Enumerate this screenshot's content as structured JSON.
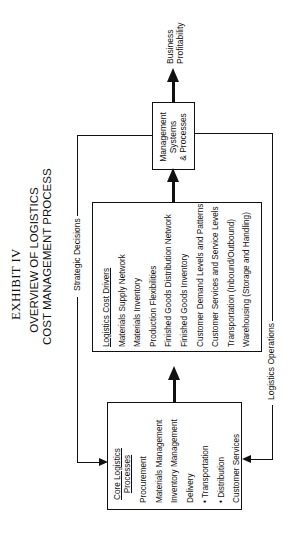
{
  "exhibit_label": "EXHIBIT IV",
  "title": {
    "line1": "OVERVIEW OF LOGISTICS",
    "line2": "COST MANAGEMENT PROCESS"
  },
  "flow_labels": {
    "strategic": "Strategic Decisions",
    "operations": "Logistics Operations"
  },
  "output": {
    "line1": "Business",
    "line2": "Profitability"
  },
  "management_box": {
    "line1": "Management",
    "line2": "Systems",
    "line3": "& Processes"
  },
  "cost_drivers": {
    "heading": "Logistics Cost Drivers",
    "items": [
      "Materials Supply Network",
      "Materials Inventory",
      "Production Flexibilities",
      "Finished Goods Distribution  Network",
      "Finished Goods Inventory",
      "Customer Demand Levels and Patterns",
      "Customer Services and Service Levels",
      "Transportation (Inbound/Outbound)",
      "Warehousing (Storage and Handling)"
    ]
  },
  "core_processes": {
    "heading1": "Core Logistics",
    "heading2": "Processes",
    "items": [
      "Procurement",
      "Materials Management",
      "Inventory Management",
      "Delivery",
      "•  Transportation",
      "•  Distribution",
      "Customer Services"
    ]
  },
  "colors": {
    "ink": "#111111",
    "background": "#ffffff"
  }
}
